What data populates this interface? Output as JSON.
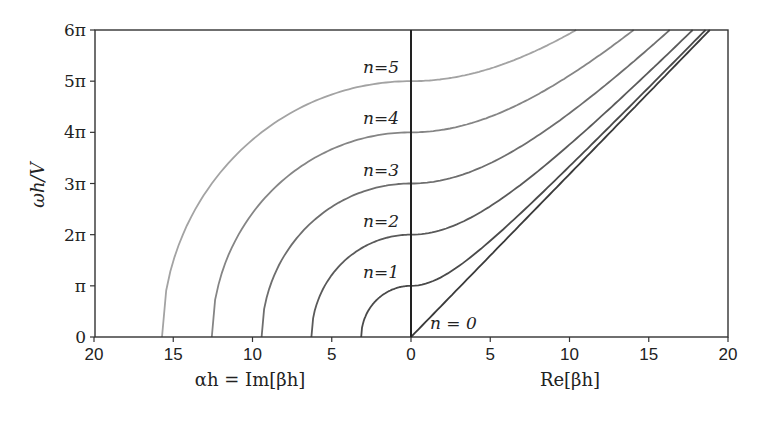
{
  "chart_data": {
    "type": "line",
    "title": "",
    "xlabel_left": "αh = Im[βh]",
    "xlabel_right": "Re[βh]",
    "ylabel": "ωh/V",
    "xlim_left": [
      20,
      0
    ],
    "xlim_right": [
      0,
      20
    ],
    "ylim": [
      0,
      18.85
    ],
    "grid": false,
    "x_ticks_left": [
      "20",
      "15",
      "10",
      "5",
      "0"
    ],
    "x_ticks_right": [
      "0",
      "5",
      "10",
      "15",
      "20"
    ],
    "y_ticks": [
      "0",
      "π",
      "2π",
      "3π",
      "4π",
      "5π",
      "6π"
    ],
    "y_tick_values": [
      0,
      3.1416,
      6.2832,
      9.4248,
      12.5664,
      15.708,
      18.8496
    ],
    "series": [
      {
        "name": "n=0",
        "n": 0,
        "color": "#3a3a3a",
        "label": "n = 0",
        "left_curve": "none",
        "right_curve": "ω = Re[βh]",
        "points_right": [
          [
            0,
            0
          ],
          [
            5,
            5
          ],
          [
            10,
            10
          ],
          [
            15,
            15
          ],
          [
            18.85,
            18.85
          ]
        ]
      },
      {
        "name": "n=1",
        "n": 1,
        "color": "#4a4a4a",
        "label": "n=1",
        "alpha_intercept": 3.14,
        "omega_at_zero": 3.14,
        "points_right": [
          [
            0,
            3.14
          ],
          [
            5,
            5.9
          ],
          [
            10,
            10.48
          ],
          [
            15,
            15.33
          ],
          [
            18.59,
            18.85
          ]
        ]
      },
      {
        "name": "n=2",
        "n": 2,
        "color": "#5a5a5a",
        "label": "n=2",
        "alpha_intercept": 6.28,
        "omega_at_zero": 6.28,
        "points_right": [
          [
            0,
            6.28
          ],
          [
            5,
            8.03
          ],
          [
            10,
            11.81
          ],
          [
            15,
            16.26
          ],
          [
            17.77,
            18.85
          ]
        ]
      },
      {
        "name": "n=3",
        "n": 3,
        "color": "#6e6e6e",
        "label": "n=3",
        "alpha_intercept": 9.42,
        "omega_at_zero": 9.42,
        "points_right": [
          [
            0,
            9.42
          ],
          [
            5,
            10.67
          ],
          [
            10,
            13.74
          ],
          [
            15,
            17.71
          ],
          [
            16.33,
            18.85
          ]
        ]
      },
      {
        "name": "n=4",
        "n": 4,
        "color": "#858585",
        "label": "n=4",
        "alpha_intercept": 12.57,
        "omega_at_zero": 12.57,
        "points_right": [
          [
            0,
            12.57
          ],
          [
            5,
            13.52
          ],
          [
            10,
            16.06
          ],
          [
            14.05,
            18.85
          ]
        ]
      },
      {
        "name": "n=5",
        "n": 5,
        "color": "#a3a3a3",
        "label": "n=5",
        "alpha_intercept": 15.71,
        "omega_at_zero": 15.71,
        "points_right": [
          [
            0,
            15.71
          ],
          [
            5,
            16.48
          ],
          [
            10,
            18.62
          ],
          [
            10.42,
            18.85
          ]
        ]
      }
    ]
  },
  "labels": {
    "n0": "n = 0",
    "n1": "n=1",
    "n2": "n=2",
    "n3": "n=3",
    "n4": "n=4",
    "n5": "n=5"
  }
}
